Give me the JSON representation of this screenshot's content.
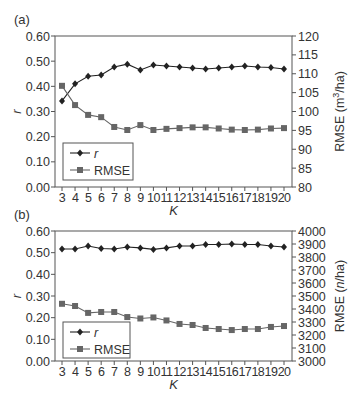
{
  "figure": {
    "panels": [
      "(a)",
      "(b)"
    ]
  },
  "chart_data": [
    {
      "type": "line",
      "panel_label": "(a)",
      "title": "",
      "xlabel": "K",
      "ylabel": "r",
      "y2label": "RMSE (m³/ha)",
      "ylabel2_base": "RMSE (m",
      "ylabel2_sup": "3",
      "ylabel2_tail": "/ha)",
      "x": [
        3,
        4,
        5,
        6,
        7,
        8,
        9,
        10,
        11,
        12,
        13,
        14,
        15,
        16,
        17,
        18,
        19,
        20
      ],
      "ylim": [
        0,
        0.6
      ],
      "yticks": [
        "0.00",
        "0.10",
        "0.20",
        "0.30",
        "0.40",
        "0.50",
        "0.60"
      ],
      "y2lim": [
        80,
        120
      ],
      "y2ticks": [
        "80",
        "85",
        "90",
        "95",
        "100",
        "105",
        "110",
        "115",
        "120"
      ],
      "grid": false,
      "legend_position": "lower-left",
      "series": [
        {
          "name": "r",
          "axis": "left",
          "marker": "diamond",
          "values": [
            0.342,
            0.41,
            0.44,
            0.445,
            0.477,
            0.488,
            0.465,
            0.485,
            0.481,
            0.477,
            0.473,
            0.469,
            0.473,
            0.477,
            0.481,
            0.477,
            0.475,
            0.469
          ]
        },
        {
          "name": "RMSE",
          "axis": "right",
          "marker": "square",
          "values": [
            106.8,
            101.7,
            99.1,
            98.5,
            95.9,
            95.1,
            96.4,
            95.1,
            95.4,
            95.6,
            95.8,
            95.8,
            95.5,
            95.2,
            95.1,
            95.2,
            95.5,
            95.6
          ]
        }
      ]
    },
    {
      "type": "line",
      "panel_label": "(b)",
      "title": "",
      "xlabel": "K",
      "ylabel": "r",
      "y2label": "RMSE (n/ha)",
      "ylabel2_base": "RMSE (",
      "ylabel2_sup": "",
      "ylabel2_italic": "n",
      "ylabel2_tail": "/ha)",
      "x": [
        3,
        4,
        5,
        6,
        7,
        8,
        9,
        10,
        11,
        12,
        13,
        14,
        15,
        16,
        17,
        18,
        19,
        20
      ],
      "ylim": [
        0,
        0.6
      ],
      "yticks": [
        "0.00",
        "0.10",
        "0.20",
        "0.30",
        "0.40",
        "0.50",
        "0.60"
      ],
      "y2lim": [
        3000,
        4000
      ],
      "y2ticks": [
        "3000",
        "3100",
        "3200",
        "3300",
        "3400",
        "3500",
        "3600",
        "3700",
        "3800",
        "3900",
        "4000"
      ],
      "grid": false,
      "legend_position": "lower-left",
      "series": [
        {
          "name": "r",
          "axis": "left",
          "marker": "diamond",
          "values": [
            0.517,
            0.517,
            0.531,
            0.519,
            0.517,
            0.526,
            0.522,
            0.515,
            0.522,
            0.531,
            0.531,
            0.538,
            0.538,
            0.54,
            0.538,
            0.538,
            0.531,
            0.526
          ]
        },
        {
          "name": "RMSE",
          "axis": "right",
          "marker": "square",
          "values": [
            3440,
            3423,
            3370,
            3377,
            3377,
            3338,
            3327,
            3335,
            3312,
            3285,
            3277,
            3254,
            3246,
            3238,
            3246,
            3246,
            3262,
            3269
          ]
        }
      ]
    }
  ],
  "style": {
    "axis_color": "#555555",
    "r_color": "#222222",
    "rmse_color": "#666666"
  }
}
